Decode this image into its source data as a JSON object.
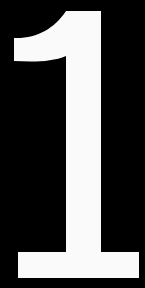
{
  "canvas": {
    "width": 145,
    "height": 288,
    "background_color": "#000000"
  },
  "content": {
    "kind": "numeral-glyph",
    "character": "1",
    "text": "1",
    "color": "#fafafa",
    "description": "Large white numeral one on a black background",
    "alignment": "center",
    "glyph_geometry": {
      "stem_left_x": 66,
      "stem_right_x": 101,
      "glyph_top_y": 11,
      "flag_left_x": 14,
      "flag_top_y": 38,
      "flag_bottom_y": 61,
      "base_left_x": 18,
      "base_right_x": 139,
      "base_top_y": 252,
      "base_bottom_y": 278,
      "path": "M 66,11 L 101,11 L 101,252 L 139,252 L 139,278 L 18,278 L 18,252 L 66,252 L 66,56 C 52,62 34,62 14,61 L 14,38 C 36,39 54,29 66,11 Z"
    }
  }
}
